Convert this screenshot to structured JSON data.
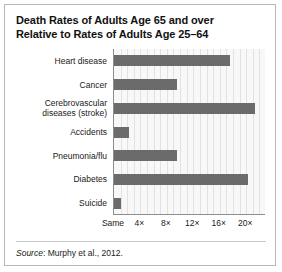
{
  "figure": {
    "title_lines": [
      "Death Rates of Adults Age 65 and over",
      "Relative to Rates of Adults Age 25–64"
    ],
    "source_prefix": "Source",
    "source_text": ": Murphy et al., 2012."
  },
  "chart_data": {
    "type": "bar",
    "orientation": "horizontal",
    "title": "Death Rates of Adults Age 65 and over Relative to Rates of Adults Age 25–64",
    "xlabel": "",
    "ylabel": "",
    "categories": [
      "Heart disease",
      "Cerebrovascular diseases (stroke)",
      "Cancer",
      "Accidents",
      "Pneumonia/flu",
      "Diabetes",
      "Suicide"
    ],
    "category_label_lines": [
      [
        "Heart disease"
      ],
      [
        "Cancer"
      ],
      [
        "Cerebrovascular",
        "diseases (stroke)"
      ],
      [
        "Accidents"
      ],
      [
        "Pneumonia/flu"
      ],
      [
        "Diabetes"
      ],
      [
        "Suicide"
      ]
    ],
    "values": [
      17.5,
      9.5,
      21.4,
      2.2,
      9.5,
      20.3,
      1.0
    ],
    "value_unit": "×",
    "xlim": [
      0,
      23
    ],
    "xticks": [
      0,
      4,
      8,
      12,
      16,
      20
    ],
    "xticklabels": [
      "Same",
      "4×",
      "8×",
      "12×",
      "16×",
      "20×"
    ],
    "gridlines_at": [
      1,
      2,
      3,
      4,
      5,
      6,
      7,
      8,
      9,
      10,
      11,
      12,
      13,
      14,
      15,
      16,
      17,
      18,
      19,
      20,
      21,
      22
    ],
    "grid": true,
    "legend": "none",
    "bar_color": "#6b6b6b",
    "plot_background": "#f8f8f8",
    "axis_color": "#8d8d8d",
    "grid_color": "#e2e2e2",
    "border_color": "#b8b8b8"
  }
}
